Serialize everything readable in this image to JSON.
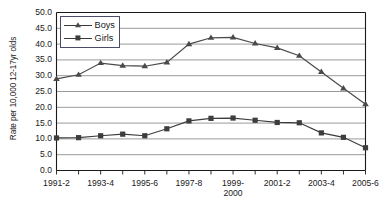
{
  "chart_data": {
    "type": "line",
    "title": "",
    "xlabel": "",
    "ylabel": "Rate per 10,000 12-17yr olds",
    "ylim": [
      0.0,
      50.0
    ],
    "ytick_labels": [
      "50.0",
      "45.0",
      "40.0",
      "35.0",
      "30.0",
      "25.0",
      "20.0",
      "15.0",
      "10.0",
      "5.0",
      "0.0"
    ],
    "ytick_values": [
      50.0,
      45.0,
      40.0,
      35.0,
      30.0,
      25.0,
      20.0,
      15.0,
      10.0,
      5.0,
      0.0
    ],
    "grid": true,
    "legend_position": "top-left",
    "categories": [
      "1991-2",
      "",
      "1993-4",
      "",
      "1995-6",
      "",
      "1997-8",
      "",
      "1999-2000",
      "",
      "2001-2",
      "",
      "2003-4",
      "",
      "2005-6"
    ],
    "xtick_labels_visible": [
      {
        "index": 0,
        "line1": "1991-2",
        "line2": ""
      },
      {
        "index": 2,
        "line1": "1993-4",
        "line2": ""
      },
      {
        "index": 4,
        "line1": "1995-6",
        "line2": ""
      },
      {
        "index": 6,
        "line1": "1997-8",
        "line2": ""
      },
      {
        "index": 8,
        "line1": "1999-",
        "line2": "2000"
      },
      {
        "index": 10,
        "line1": "2001-2",
        "line2": ""
      },
      {
        "index": 12,
        "line1": "2003-4",
        "line2": ""
      },
      {
        "index": 14,
        "line1": "2005-6",
        "line2": ""
      }
    ],
    "series": [
      {
        "name": "Boys",
        "marker": "triangle",
        "color": "#4a4a4a",
        "values": [
          29.0,
          30.3,
          34.0,
          33.2,
          33.0,
          34.2,
          40.0,
          42.0,
          42.1,
          40.2,
          38.8,
          36.3,
          31.2,
          26.0,
          21.0
        ]
      },
      {
        "name": "Girls",
        "marker": "square",
        "color": "#3d3d3d",
        "values": [
          10.3,
          10.4,
          11.0,
          11.5,
          11.0,
          13.2,
          15.7,
          16.5,
          16.6,
          15.9,
          15.2,
          15.1,
          11.9,
          10.5,
          7.2
        ]
      }
    ]
  },
  "legend": {
    "items": [
      {
        "label": "Boys"
      },
      {
        "label": "Girls"
      }
    ]
  }
}
